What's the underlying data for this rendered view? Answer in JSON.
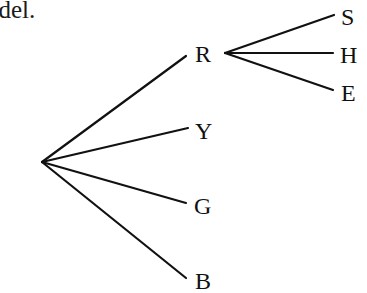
{
  "caption": "odel.",
  "tree": {
    "root": "",
    "children": [
      {
        "label": "R",
        "children": [
          {
            "label": "S"
          },
          {
            "label": "H"
          },
          {
            "label": "E"
          }
        ]
      },
      {
        "label": "Y",
        "children": []
      },
      {
        "label": "G",
        "children": []
      },
      {
        "label": "B",
        "children": []
      }
    ]
  }
}
